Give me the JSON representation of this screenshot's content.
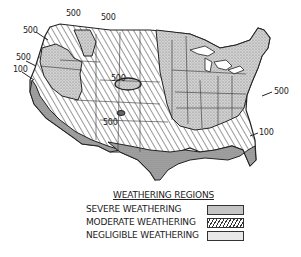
{
  "map": {
    "contour_labels": [
      {
        "text": "500",
        "x": 66,
        "y": 15
      },
      {
        "text": "500",
        "x": 101,
        "y": 19
      },
      {
        "text": "500",
        "x": 23,
        "y": 30
      },
      {
        "text": "500",
        "x": 16,
        "y": 56
      },
      {
        "text": "100",
        "x": 13,
        "y": 68
      },
      {
        "text": "500",
        "x": 111,
        "y": 76
      },
      {
        "text": "500",
        "x": 103,
        "y": 119
      },
      {
        "text": "500",
        "x": 274,
        "y": 89
      },
      {
        "text": "100",
        "x": 259,
        "y": 130
      }
    ],
    "colors": {
      "severe": "#c4c4c4",
      "moderate_hatch": "#333333",
      "negligible": "#9a9a9a",
      "border": "#222222"
    }
  },
  "legend": {
    "title": "WEATHERING REGIONS",
    "items": [
      {
        "label": "SEVERE WEATHERING",
        "pattern": "light-stipple"
      },
      {
        "label": "MODERATE WEATHERING",
        "pattern": "diagonal-hatch"
      },
      {
        "label": "NEGLIGIBLE WEATHERING",
        "pattern": "dense-stipple"
      }
    ]
  }
}
